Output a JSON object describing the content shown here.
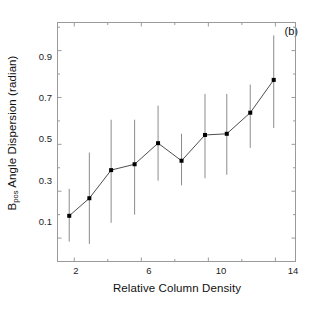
{
  "figure": {
    "panel_label": "(b)",
    "background_color": "#ffffff",
    "frame_color": "#9a9a9a",
    "data_color": "#000000",
    "errorbar_color": "#8c8c8c"
  },
  "chart_data": {
    "type": "scatter",
    "title": "",
    "panel": "(b)",
    "xlabel": "Relative Column Density",
    "ylabel_parts": {
      "main": "B",
      "subscript": "pos",
      "rest": " Angle Dispersion (radian)",
      "superscript": ""
    },
    "ylabel": "Bpos Angle Dispersion (radian)",
    "xlim": [
      1.0,
      15.2
    ],
    "ylim": [
      0.0,
      1.02
    ],
    "xticks": [
      2,
      6,
      10,
      14
    ],
    "xtick_labels": [
      "2",
      "6",
      "10",
      "14"
    ],
    "xticks_minor": [
      4,
      8,
      12
    ],
    "yticks": [
      0.1,
      0.3,
      0.5,
      0.7,
      0.9
    ],
    "ytick_labels": [
      "0.1",
      "0.3",
      "0.5",
      "0.7",
      "0.9"
    ],
    "yticks_minor": [
      0.2,
      0.4,
      0.6,
      0.8,
      1.0
    ],
    "grid": false,
    "legend": null,
    "marker": "square",
    "line_style": "solid",
    "series": [
      {
        "name": "Bpos angle dispersion",
        "x": [
          1.7,
          2.9,
          4.2,
          5.6,
          7.0,
          8.4,
          9.8,
          11.1,
          12.5,
          13.9
        ],
        "y": [
          0.195,
          0.27,
          0.39,
          0.415,
          0.505,
          0.43,
          0.54,
          0.545,
          0.635,
          0.775
        ],
        "y_err_low": [
          0.085,
          0.075,
          0.165,
          0.2,
          0.345,
          0.325,
          0.355,
          0.37,
          0.485,
          0.57
        ],
        "y_err_high": [
          0.31,
          0.465,
          0.605,
          0.605,
          0.665,
          0.545,
          0.715,
          0.715,
          0.755,
          0.965
        ]
      }
    ]
  }
}
